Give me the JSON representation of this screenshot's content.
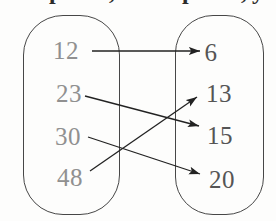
{
  "figure": {
    "type": "arrow-mapping-diagram",
    "left_set": {
      "items": [
        "12",
        "23",
        "30",
        "48"
      ]
    },
    "right_set": {
      "items": [
        "6",
        "13",
        "15",
        "20"
      ]
    },
    "mappings": [
      {
        "from": "12",
        "to": "6"
      },
      {
        "from": "23",
        "to": "15"
      },
      {
        "from": "30",
        "to": "20"
      },
      {
        "from": "48",
        "to": "13"
      }
    ]
  },
  "top_cropped_fragments": [
    "p",
    ",",
    "p",
    ",",
    "y"
  ],
  "colors": {
    "left_numbers": "#909090",
    "right_numbers": "#555555",
    "arrow": "#222222",
    "oval_outline": "#474747",
    "background": "#fdfdfc"
  }
}
